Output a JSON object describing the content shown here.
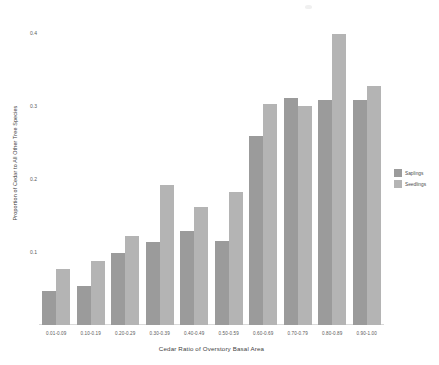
{
  "chart_data": {
    "type": "bar",
    "title": "",
    "xlabel": "Cedar Ratio of Overstory Basal Area",
    "ylabel": "Proportion of Cedar to All Other Tree Species",
    "categories": [
      "0.01-0.09",
      "0.10-0.19",
      "0.20-0.29",
      "0.30-0.39",
      "0.40-0.49",
      "0.50-0.59",
      "0.60-0.69",
      "0.70-0.79",
      "0.80-0.89",
      "0.90-1.00"
    ],
    "series": [
      {
        "name": "Saplings",
        "color": "#9b9b9b",
        "values": [
          0.047,
          0.054,
          0.098,
          0.113,
          0.128,
          0.115,
          0.258,
          0.311,
          0.308,
          0.308
        ]
      },
      {
        "name": "Seedlings",
        "color": "#b4b4b4",
        "values": [
          0.077,
          0.088,
          0.122,
          0.191,
          0.162,
          0.182,
          0.302,
          0.3,
          0.398,
          0.327
        ]
      }
    ],
    "ylim": [
      0,
      0.42
    ],
    "yticks": [
      0.1,
      0.2,
      0.3,
      0.4
    ],
    "ytick_labels": [
      "0.1",
      "0.2",
      "0.3",
      "0.4"
    ],
    "grid": false,
    "legend_position": "right"
  },
  "legend": {
    "entries": [
      {
        "label": "Saplings",
        "color": "#9b9b9b"
      },
      {
        "label": "Seedlings",
        "color": "#b4b4b4"
      }
    ]
  }
}
